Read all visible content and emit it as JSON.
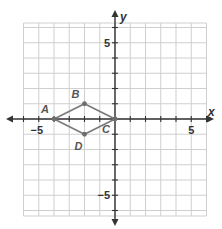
{
  "diagram": {
    "type": "coordinate-plane",
    "x_axis": {
      "label": "x",
      "range": [
        -6,
        6
      ],
      "tick_labels": [
        {
          "value": -5,
          "text": "−5"
        },
        {
          "value": 5,
          "text": "5"
        }
      ]
    },
    "y_axis": {
      "label": "y",
      "range": [
        -6.3,
        6.3
      ],
      "tick_labels": [
        {
          "value": 5,
          "text": "5"
        },
        {
          "value": -5,
          "text": "−5"
        }
      ]
    },
    "grid": true,
    "polygon": {
      "name": "ABCD",
      "vertices": [
        {
          "label": "A",
          "x": -4,
          "y": 0,
          "label_pos": "upper-left"
        },
        {
          "label": "B",
          "x": -2,
          "y": 1,
          "label_pos": "upper-left"
        },
        {
          "label": "C",
          "x": 0,
          "y": 0,
          "label_pos": "lower-left"
        },
        {
          "label": "D",
          "x": -2,
          "y": -1,
          "label_pos": "below-left"
        }
      ]
    },
    "colors": {
      "grid": "#cfcfcf",
      "axes": "#333333",
      "polygon": "#7a7a7a"
    }
  }
}
